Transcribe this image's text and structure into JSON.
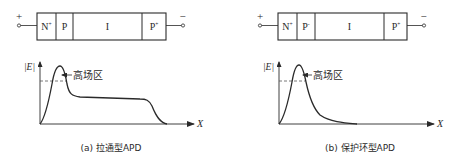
{
  "panels": [
    {
      "id": "a",
      "caption": "(a) 拉通型APD",
      "terminals": {
        "positive": "+",
        "negative": "−"
      },
      "layers": [
        {
          "label": "N",
          "sup": "+"
        },
        {
          "label": "P",
          "sup": ""
        },
        {
          "label": "I",
          "sup": ""
        },
        {
          "label": "P",
          "sup": "+"
        }
      ],
      "plot": {
        "ylabel": "|E|",
        "xlabel": "X",
        "annotation": "高场区"
      }
    },
    {
      "id": "b",
      "caption": "(b) 保护环型APD",
      "terminals": {
        "positive": "+",
        "negative": "−"
      },
      "layers": [
        {
          "label": "N",
          "sup": "+"
        },
        {
          "label": "P",
          "sup": "-"
        },
        {
          "label": "I",
          "sup": ""
        },
        {
          "label": "P",
          "sup": "+"
        }
      ],
      "plot": {
        "ylabel": "|E|",
        "xlabel": "X",
        "annotation": "高场区"
      }
    }
  ],
  "colors": {
    "line": "#2a2a2a",
    "dash": "#555555"
  }
}
